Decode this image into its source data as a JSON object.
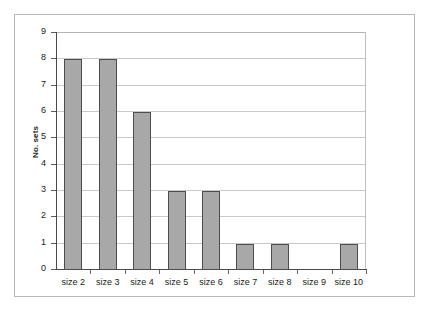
{
  "chart_data": {
    "type": "bar",
    "title": "",
    "xlabel": "",
    "ylabel": "No. sets",
    "categories": [
      "size 2",
      "size 3",
      "size 4",
      "size 5",
      "size 6",
      "size 7",
      "size 8",
      "size 9",
      "size 10"
    ],
    "values": [
      8,
      8,
      6,
      3,
      3,
      1,
      1,
      0,
      1
    ],
    "ylim": [
      0,
      9
    ],
    "ytick_labels": [
      "9",
      "8",
      "7",
      "6",
      "5",
      "4",
      "3",
      "2",
      "1",
      "0"
    ],
    "ytick_values": [
      9,
      8,
      7,
      6,
      5,
      4,
      3,
      2,
      1,
      0
    ],
    "grid": true,
    "legend": null,
    "colors": {
      "bar_fill": "#a8a8a8",
      "bar_border": "#4d4d4d",
      "gridline": "#c9c9c9",
      "axis": "#4a4a4a",
      "frame": "#b9b9b9",
      "text": "#1a1a1a",
      "background": "#ffffff"
    }
  }
}
